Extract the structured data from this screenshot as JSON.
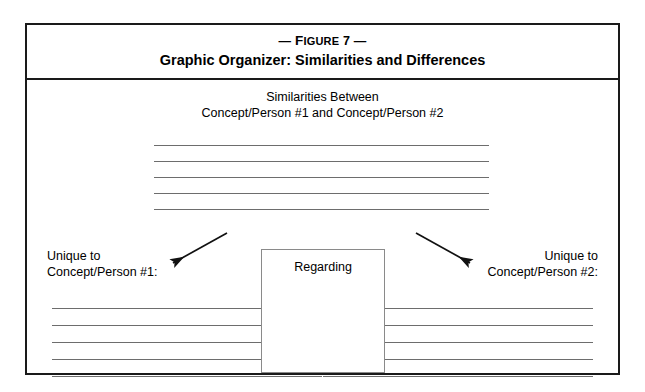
{
  "figure": {
    "label_prefix": "—",
    "label_word": "Figure",
    "label_number": "7",
    "label_suffix": "—",
    "title": "Graphic Organizer: Similarities and Differences"
  },
  "similarities": {
    "heading_line1": "Similarities Between",
    "heading_line2": "Concept/Person #1 and Concept/Person #2",
    "line_count": 5
  },
  "arrows": {
    "left": "arrow-down-left",
    "right": "arrow-down-right"
  },
  "unique_left": {
    "label_line1": "Unique to",
    "label_line2": "Concept/Person #1:",
    "line_count": 5
  },
  "unique_right": {
    "label_line1": "Unique to",
    "label_line2": "Concept/Person #2:",
    "line_count": 5
  },
  "regarding": {
    "label": "Regarding"
  },
  "colors": {
    "frame": "#1a1a1a",
    "rule": "#6d6d6d",
    "box_border": "#8a8a8a",
    "text": "#000000",
    "background": "#ffffff"
  }
}
